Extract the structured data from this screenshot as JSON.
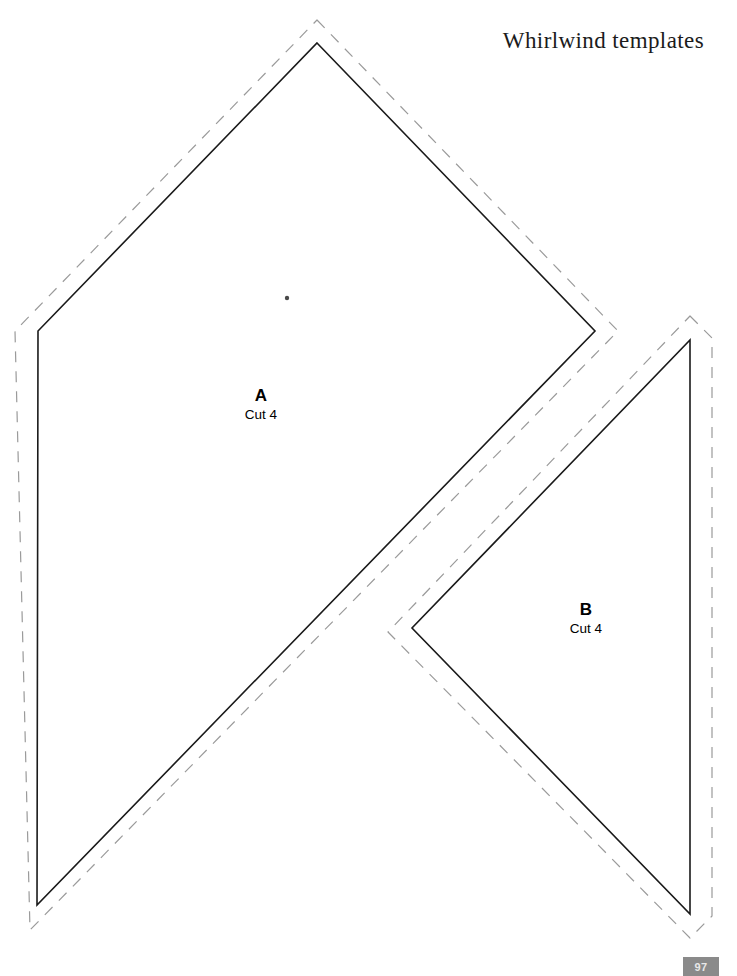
{
  "document": {
    "title": "Whirlwind templates",
    "page_number": "97",
    "background_color": "#ffffff"
  },
  "colors": {
    "solid_cut_line": "#1a1a1a",
    "dashed_seam_line": "#9a9a9a",
    "center_dot": "#4a4a4a",
    "page_badge_background": "#8a8a8a",
    "page_badge_text": "#e8e8e8",
    "text": "#000000"
  },
  "pieces": [
    {
      "id": "a",
      "letter": "A",
      "cut_instruction": "Cut 4",
      "shape": "diamond",
      "solid_points": "317,43 595,331 37,905 38,331",
      "dashed_points": "317,20 618,331 30,930 15,331",
      "center_dot": {
        "x": 287,
        "y": 298,
        "r": 2.2
      },
      "label": {
        "x": 261,
        "y": 400
      }
    },
    {
      "id": "b",
      "letter": "B",
      "cut_instruction": "Cut 4",
      "shape": "chevron",
      "solid_points": "690,340 690,914 412,628",
      "dashed_points": "690,316 712,338 712,916 690,938 388,632",
      "label": {
        "x": 586,
        "y": 614
      }
    }
  ],
  "legend": {
    "solid_line_meaning": "cutting line",
    "dashed_line_meaning": "seam allowance line"
  }
}
